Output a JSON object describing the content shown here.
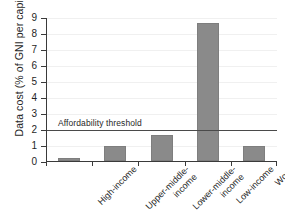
{
  "chart_data": {
    "type": "bar",
    "title": "",
    "xlabel": "",
    "ylabel": "Data cost (% of GNI per capita)",
    "categories": [
      "High-income",
      "Upper-middle-income",
      "Lower-middle-income",
      "Low-income",
      "World"
    ],
    "category_lines": [
      [
        "High-income"
      ],
      [
        "Upper-middle-",
        "income"
      ],
      [
        "Lower-middle-",
        "income"
      ],
      [
        "Low-income"
      ],
      [
        "World"
      ]
    ],
    "values": [
      0.2,
      0.93,
      1.65,
      8.6,
      0.93
    ],
    "ylim": [
      0,
      9
    ],
    "ytick_labels": [
      "0",
      "1",
      "2",
      "3",
      "4",
      "5",
      "6",
      "7",
      "8",
      "9"
    ],
    "ytick_values": [
      0,
      1,
      2,
      3,
      4,
      5,
      6,
      7,
      8,
      9
    ],
    "grid": true,
    "legend": "none",
    "annotations": [
      {
        "name": "affordability-threshold",
        "label": "Affordability threshold",
        "value": 2,
        "orientation": "horizontal"
      }
    ],
    "colors": {
      "bar": "#8a8a8a",
      "axis": "#3a3a3a",
      "grid": "#f0f0f0",
      "threshold": "#4a4a4a",
      "background": "#ffffff",
      "text": "#1f1f1f"
    }
  }
}
